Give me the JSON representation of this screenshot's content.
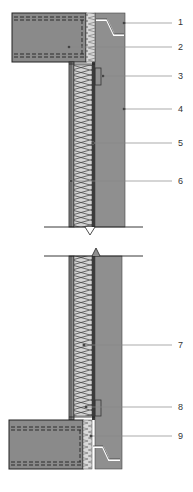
{
  "diagram": {
    "type": "construction-section-detail",
    "colors": {
      "concrete": "#8f8f8f",
      "slab": "#8a8a8a",
      "insulation": "#d4d4d4",
      "outline": "#2a2a2a",
      "leader": "#888888",
      "background": "#ffffff"
    },
    "callouts": [
      {
        "id": "1",
        "label": "1",
        "y": 22
      },
      {
        "id": "2",
        "label": "2",
        "y": 47
      },
      {
        "id": "3",
        "label": "3",
        "y": 76
      },
      {
        "id": "4",
        "label": "4",
        "y": 108
      },
      {
        "id": "5",
        "label": "5",
        "y": 143
      },
      {
        "id": "6",
        "label": "6",
        "y": 181
      },
      {
        "id": "7",
        "label": "7",
        "y": 345
      },
      {
        "id": "8",
        "label": "8",
        "y": 407
      },
      {
        "id": "9",
        "label": "9",
        "y": 436
      }
    ]
  }
}
